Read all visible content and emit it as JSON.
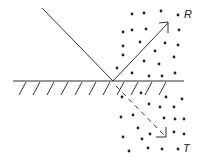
{
  "diagram": {
    "title": "",
    "labels": {
      "reflected": "R",
      "transmitted": "T"
    },
    "elements": {
      "surface": "interface-line",
      "incident_ray": "solid line",
      "reflected_ray": "solid arrow",
      "transmitted_ray": "dashed arrow",
      "scatterers_above": 22,
      "scatterers_below": 22
    },
    "colors": {
      "ink": "#222222",
      "background": "#ffffff"
    }
  }
}
